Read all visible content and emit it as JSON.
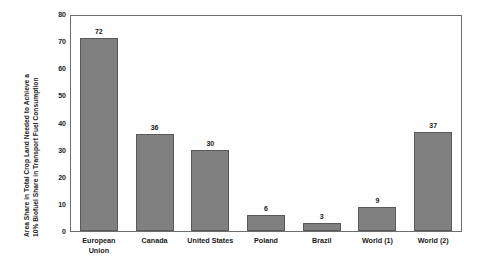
{
  "chart_data": {
    "type": "bar",
    "title": "",
    "subtitle": "",
    "xlabel": "",
    "ylabel": "Area Share in Total Crop Land Needed to Achieve a 10% Biofuel Share in Transport Fuel Consumption",
    "ylabel_lines": [
      "Area Share in Total Crop Land Needed to Achieve a",
      "10%  Biofuel Share in Transport Fuel Consumption"
    ],
    "categories": [
      "European Union",
      "Canada",
      "United States",
      "Poland",
      "Brazil",
      "World (1)",
      "World (2)"
    ],
    "category_lines": [
      [
        "European",
        "Union"
      ],
      [
        "Canada"
      ],
      [
        "United States"
      ],
      [
        "Poland"
      ],
      [
        "Brazil"
      ],
      [
        "World (1)"
      ],
      [
        "World (2)"
      ]
    ],
    "values": [
      72,
      36,
      30,
      6,
      3,
      9,
      37
    ],
    "value_labels": [
      "72",
      "36",
      "30",
      "6",
      "3",
      "9",
      "37"
    ],
    "ylim": [
      0,
      80
    ],
    "yticks": [
      80,
      70,
      60,
      50,
      40,
      30,
      20,
      10,
      0
    ],
    "ytick_labels": [
      "80",
      "70",
      "60",
      "50",
      "40",
      "30",
      "20",
      "10",
      "0"
    ],
    "grid": false,
    "legend": null,
    "legend_position": "none",
    "colors": {
      "bar_fill": "#808080",
      "bar_edge": "#5a5a5a",
      "plot_background": "#fefefe",
      "frame": "#6e6e6e",
      "text": "#1a1a1a",
      "page_background": "#ffffff"
    }
  }
}
